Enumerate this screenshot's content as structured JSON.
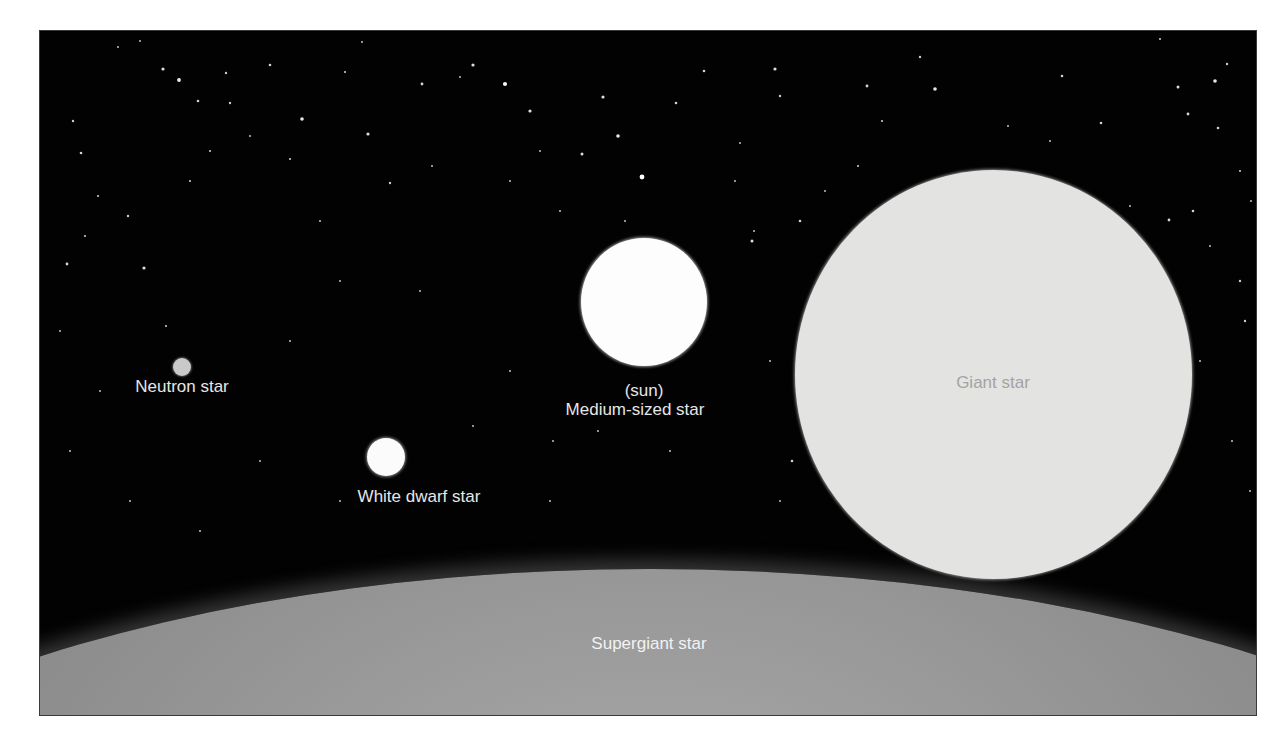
{
  "figure": {
    "background_color": "#020202",
    "frame_border_color": "#3a3a3a"
  },
  "stars": [
    {
      "id": "neutron",
      "label": "Neutron star",
      "color": "#c9c9c9",
      "cx": 142,
      "cy": 336,
      "r": 9
    },
    {
      "id": "white-dwarf",
      "label": "White dwarf star",
      "color": "#fbfbfb",
      "cx": 346,
      "cy": 426,
      "r": 19
    },
    {
      "id": "sun",
      "label_line1": "(sun)",
      "label_line2": "Medium-sized star",
      "color": "#fdfdfd",
      "cx": 604,
      "cy": 270,
      "r": 63
    },
    {
      "id": "giant",
      "label": "Giant star",
      "color": "#e3e3e1",
      "cx": 953,
      "cy": 342,
      "r": 198
    },
    {
      "id": "supergiant",
      "label": "Supergiant star",
      "color": "#9a9a9a"
    }
  ],
  "background_stars": [
    [
      123,
      38,
      1.6
    ],
    [
      139,
      49,
      1.9
    ],
    [
      100,
      10,
      1
    ],
    [
      78,
      16,
      1
    ],
    [
      158,
      70,
      1.3
    ],
    [
      186,
      42,
      1.2
    ],
    [
      190,
      72,
      1.2
    ],
    [
      230,
      34,
      1.3
    ],
    [
      262,
      88,
      1.8
    ],
    [
      305,
      41,
      1.1
    ],
    [
      322,
      11,
      1
    ],
    [
      328,
      103,
      1.6
    ],
    [
      350,
      152,
      1.2
    ],
    [
      382,
      53,
      1.4
    ],
    [
      433,
      34,
      1.6
    ],
    [
      465,
      53,
      2.1
    ],
    [
      420,
      46,
      1
    ],
    [
      490,
      80,
      1.6
    ],
    [
      563,
      66,
      1.6
    ],
    [
      578,
      105,
      1.8
    ],
    [
      542,
      123,
      1.5
    ],
    [
      602,
      146,
      2.4
    ],
    [
      636,
      72,
      1.3
    ],
    [
      664,
      40,
      1.3
    ],
    [
      735,
      38,
      1.6
    ],
    [
      740,
      65,
      1.2
    ],
    [
      827,
      55,
      1.4
    ],
    [
      880,
      26,
      1.2
    ],
    [
      895,
      58,
      1.8
    ],
    [
      1022,
      45,
      1.3
    ],
    [
      1061,
      92,
      1.3
    ],
    [
      1138,
      56,
      1.5
    ],
    [
      1175,
      50,
      1.8
    ],
    [
      1187,
      33,
      1.2
    ],
    [
      1148,
      83,
      1.4
    ],
    [
      1178,
      97,
      1.3
    ],
    [
      1120,
      8,
      1.1
    ],
    [
      1200,
      140,
      1.1
    ],
    [
      1211,
      170,
      1
    ],
    [
      1200,
      250,
      1.2
    ],
    [
      1153,
      180,
      1.3
    ],
    [
      1129,
      189,
      1.4
    ],
    [
      33,
      90,
      1.2
    ],
    [
      41,
      122,
      1.3
    ],
    [
      58,
      165,
      1.1
    ],
    [
      45,
      205,
      1.1
    ],
    [
      27,
      233,
      1.4
    ],
    [
      104,
      237,
      1.6
    ],
    [
      126,
      295,
      1.1
    ],
    [
      88,
      185,
      1.2
    ],
    [
      250,
      128,
      1.1
    ],
    [
      210,
      105,
      1
    ],
    [
      170,
      120,
      1.1
    ],
    [
      280,
      190,
      1
    ],
    [
      392,
      135,
      1
    ],
    [
      470,
      150,
      1
    ],
    [
      500,
      120,
      1
    ],
    [
      520,
      180,
      1
    ],
    [
      585,
      190,
      1
    ],
    [
      700,
      112,
      1
    ],
    [
      760,
      190,
      1.3
    ],
    [
      714,
      200,
      1
    ],
    [
      695,
      150,
      1
    ],
    [
      712,
      210,
      1.5
    ],
    [
      785,
      160,
      1
    ],
    [
      790,
      250,
      1
    ],
    [
      842,
      90,
      1.1
    ],
    [
      818,
      135,
      1.1
    ],
    [
      968,
      95,
      1
    ],
    [
      1010,
      110,
      1
    ],
    [
      1090,
      175,
      1
    ],
    [
      1170,
      215,
      1
    ],
    [
      1160,
      330,
      1
    ],
    [
      752,
      430,
      1.3
    ],
    [
      740,
      470,
      1
    ],
    [
      433,
      395,
      1
    ],
    [
      470,
      340,
      1
    ],
    [
      513,
      410,
      1
    ],
    [
      558,
      400,
      1
    ],
    [
      630,
      420,
      1
    ],
    [
      300,
      470,
      1
    ],
    [
      220,
      430,
      1
    ],
    [
      60,
      360,
      1
    ],
    [
      30,
      420,
      1
    ],
    [
      90,
      470,
      1
    ],
    [
      160,
      500,
      1
    ],
    [
      510,
      470,
      1
    ],
    [
      1205,
      290,
      1.2
    ],
    [
      1192,
      410,
      1
    ],
    [
      1210,
      460,
      1
    ],
    [
      785,
      448,
      1.2
    ],
    [
      730,
      330,
      1
    ],
    [
      250,
      310,
      1
    ],
    [
      300,
      250,
      1
    ],
    [
      380,
      260,
      1
    ],
    [
      20,
      300,
      1
    ],
    [
      150,
      150,
      1.1
    ]
  ]
}
